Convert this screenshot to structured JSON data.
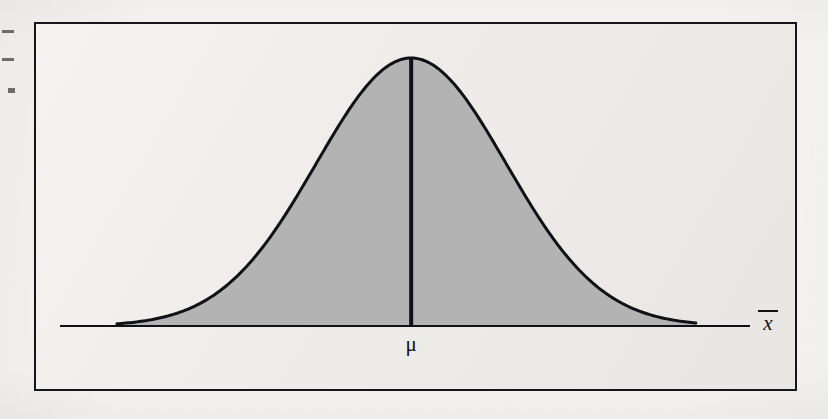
{
  "figure": {
    "kind": "normal-distribution-curve",
    "caption_text": "",
    "frame": {
      "border_color": "#15161a",
      "fill_color": "#eceae6"
    },
    "labels": {
      "mean_symbol": "μ",
      "sample_mean_symbol": "x",
      "sample_mean_has_overbar": true
    },
    "colors": {
      "page_background": "#f6f5f2",
      "curve_stroke": "#101114",
      "curve_fill": "#b3b3b3",
      "axis_stroke": "#101114",
      "center_line": "#101114"
    }
  },
  "chart_data": {
    "type": "area",
    "title": "",
    "subtitle": "",
    "xlabel": "x̄",
    "ylabel": "",
    "grid": false,
    "legend": null,
    "distribution": "normal",
    "mean": 0,
    "std_dev": 1,
    "peak_height": 1.0,
    "shaded_range": [
      -3.1,
      3.0
    ],
    "axis_range": [
      -3.7,
      3.57
    ],
    "annotations": [
      {
        "label": "μ",
        "x": 0,
        "position": "below-axis",
        "kind": "mean-marker"
      },
      {
        "label": "x̄",
        "x": 3.57,
        "position": "axis-end-right",
        "kind": "axis-title"
      }
    ],
    "center_line": {
      "x": 0,
      "from_y": 0,
      "to_y": 1.0,
      "width_px": 4
    },
    "x": [
      -3.1,
      -2.9,
      -2.7,
      -2.5,
      -2.3,
      -2.1,
      -1.9,
      -1.7,
      -1.5,
      -1.3,
      -1.1,
      -0.9,
      -0.7,
      -0.5,
      -0.3,
      -0.1,
      0.1,
      0.3,
      0.5,
      0.7,
      0.9,
      1.1,
      1.3,
      1.5,
      1.7,
      1.9,
      2.1,
      2.3,
      2.5,
      2.7,
      2.9,
      3.0
    ],
    "values": [
      0.008,
      0.015,
      0.026,
      0.044,
      0.07,
      0.11,
      0.164,
      0.237,
      0.325,
      0.43,
      0.546,
      0.667,
      0.783,
      0.882,
      0.956,
      0.995,
      0.995,
      0.956,
      0.882,
      0.783,
      0.667,
      0.546,
      0.43,
      0.325,
      0.237,
      0.164,
      0.11,
      0.07,
      0.044,
      0.026,
      0.015,
      0.011
    ]
  },
  "ghost_text": {
    "note": "faint bleed-through from reverse side of the scanned page; largely illegible",
    "lines": [
      {
        "text": "an increase in mass. To find out just how much mass the",
        "x": 210,
        "y": 26,
        "size": 13
      },
      {
        "text": "volume, the lessons of",
        "x": 300,
        "y": 50,
        "size": 13
      },
      {
        "text": "In the course of the preceding chapter, the first cause of",
        "x": 230,
        "y": 88,
        "size": 13
      },
      {
        "text": "rather than that. Consider the following questions:",
        "x": 248,
        "y": 110,
        "size": 13
      },
      {
        "text": "Seven of a kind",
        "x": 222,
        "y": 168,
        "size": 14
      },
      {
        "text": "A typical result in a sample of nine is that it will only be found",
        "x": 60,
        "y": 240,
        "size": 12
      },
      {
        "text": "on the part of the sample, but also on the distribution",
        "x": 86,
        "y": 262,
        "size": 12
      },
      {
        "text": "Figure 6 continued",
        "x": 38,
        "y": 352,
        "size": 12
      },
      {
        "text": "Chapter 5",
        "x": 640,
        "y": 354,
        "size": 12
      }
    ]
  },
  "artifacts": {
    "specks": [
      {
        "x": 2,
        "y": 30,
        "w": 12,
        "h": 3
      },
      {
        "x": 2,
        "y": 58,
        "w": 12,
        "h": 3
      },
      {
        "x": 8,
        "y": 88,
        "w": 7,
        "h": 5
      }
    ]
  }
}
